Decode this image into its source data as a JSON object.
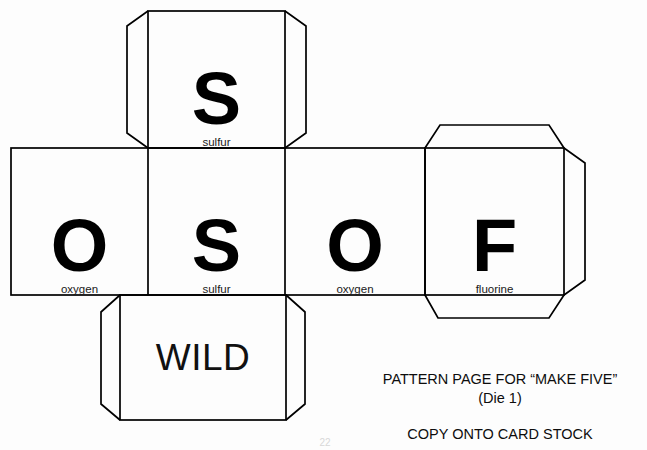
{
  "document": {
    "type": "die-net-pattern",
    "background_color": "#fdfdfd",
    "line_color": "#000000"
  },
  "faces": [
    {
      "id": "top-sulfur",
      "symbol": "S",
      "name": "sulfur",
      "position": "top"
    },
    {
      "id": "left-oxygen",
      "symbol": "O",
      "name": "oxygen",
      "position": "middle-left"
    },
    {
      "id": "center-sulfur",
      "symbol": "S",
      "name": "sulfur",
      "position": "middle-center"
    },
    {
      "id": "right-oxygen",
      "symbol": "O",
      "name": "oxygen",
      "position": "middle-right"
    },
    {
      "id": "far-right-fluorine",
      "symbol": "F",
      "name": "fluorine",
      "position": "middle-far-right"
    },
    {
      "id": "bottom-wild",
      "symbol": "WILD",
      "name": "",
      "position": "bottom"
    }
  ],
  "caption": {
    "line1": "PATTERN PAGE FOR “MAKE FIVE”",
    "line2": "(Die 1)",
    "line3": "COPY ONTO CARD STOCK"
  },
  "footer": {
    "page_mark": "22"
  }
}
